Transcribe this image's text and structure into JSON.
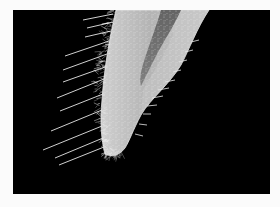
{
  "figure": {
    "background_color": "#fbfbfb",
    "panel_color": "#000000",
    "panel": {
      "x": 13,
      "y": 10,
      "width": 257,
      "height": 184
    }
  },
  "colors": {
    "root_fill": "#bdbdbd",
    "root_light": "#d4d4d4",
    "canal_dark": "#6a6a6a",
    "vector_line": "#e8e8e8",
    "outline": "#eeeeee"
  },
  "root": {
    "outline_path": "M 103 0 L 196 0 C 184 18, 176 40, 168 55 C 156 75, 138 88, 128 105 C 120 120, 116 132, 112 138 C 106 146, 98 147, 92 144 C 88 130, 87 110, 89 90 C 91 60, 96 30, 103 0 Z",
    "canal_path": "M 148 0 L 168 0 C 160 18, 150 32, 142 48 C 136 60, 132 68, 128 76 C 126 70, 128 60, 132 48 C 138 30, 144 14, 148 0 Z",
    "highlight_path": "M 155 0 L 196 0 C 184 18, 176 40, 168 55 C 156 75, 138 88, 128 105 L 130 80 C 140 62, 152 45, 160 25 Z"
  },
  "vectors_left": [
    {
      "x1": 100,
      "y1": 4,
      "x2": 70,
      "y2": 10
    },
    {
      "x1": 100,
      "y1": 12,
      "x2": 74,
      "y2": 18
    },
    {
      "x1": 98,
      "y1": 21,
      "x2": 72,
      "y2": 27
    },
    {
      "x1": 96,
      "y1": 31,
      "x2": 52,
      "y2": 46
    },
    {
      "x1": 94,
      "y1": 44,
      "x2": 50,
      "y2": 60
    },
    {
      "x1": 92,
      "y1": 57,
      "x2": 50,
      "y2": 72
    },
    {
      "x1": 91,
      "y1": 69,
      "x2": 44,
      "y2": 88
    },
    {
      "x1": 90,
      "y1": 84,
      "x2": 47,
      "y2": 101
    },
    {
      "x1": 89,
      "y1": 100,
      "x2": 38,
      "y2": 121
    },
    {
      "x1": 89,
      "y1": 116,
      "x2": 30,
      "y2": 140
    },
    {
      "x1": 90,
      "y1": 128,
      "x2": 42,
      "y2": 148
    },
    {
      "x1": 91,
      "y1": 137,
      "x2": 46,
      "y2": 155
    }
  ],
  "vectors_right": [
    {
      "x1": 178,
      "y1": 32,
      "x2": 186,
      "y2": 30
    },
    {
      "x1": 172,
      "y1": 42,
      "x2": 180,
      "y2": 40
    },
    {
      "x1": 166,
      "y1": 52,
      "x2": 174,
      "y2": 50
    },
    {
      "x1": 160,
      "y1": 62,
      "x2": 168,
      "y2": 60
    },
    {
      "x1": 152,
      "y1": 72,
      "x2": 162,
      "y2": 70
    },
    {
      "x1": 145,
      "y1": 80,
      "x2": 156,
      "y2": 78
    },
    {
      "x1": 139,
      "y1": 88,
      "x2": 150,
      "y2": 86
    },
    {
      "x1": 134,
      "y1": 96,
      "x2": 144,
      "y2": 95
    },
    {
      "x1": 130,
      "y1": 104,
      "x2": 138,
      "y2": 104
    },
    {
      "x1": 126,
      "y1": 114,
      "x2": 134,
      "y2": 115
    },
    {
      "x1": 122,
      "y1": 124,
      "x2": 130,
      "y2": 126
    }
  ]
}
